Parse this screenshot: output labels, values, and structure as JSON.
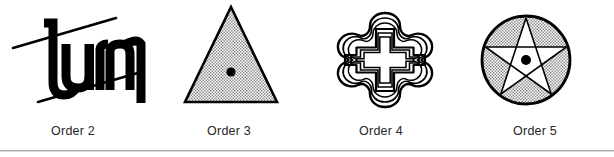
{
  "figure": {
    "background_color": "#ffffff",
    "ink_color": "#000000",
    "caption_color": "#262626",
    "rule_color": "#a8a8a8",
    "stipple_color": "#b5b5b5",
    "panels": [
      {
        "id": "panel-order-2",
        "caption": "Order 2",
        "order": 2,
        "symmetry": "2-fold rotational",
        "artwork_name": "turn-ambigram",
        "artwork_text": "turn",
        "description": "Ambigram lettering of the word turn with two parallel slanted rules",
        "has_center_dot": false,
        "fill": "solid-black-lettering"
      },
      {
        "id": "panel-order-3",
        "caption": "Order 3",
        "order": 3,
        "symmetry": "3-fold rotational",
        "artwork_name": "stippled-triangle",
        "artwork_text": "",
        "description": "Equilateral triangle with stippled gray fill and black center dot",
        "has_center_dot": true,
        "fill": "stipple-gray"
      },
      {
        "id": "panel-order-4",
        "caption": "Order 4",
        "order": 4,
        "symmetry": "4-fold rotational",
        "artwork_name": "nested-quatrefoil-cross",
        "artwork_text": "",
        "description": "Nested concentric wavy cross or quatrefoil outlines, white fill",
        "has_center_dot": false,
        "fill": "white-outline"
      },
      {
        "id": "panel-order-5",
        "caption": "Order 5",
        "order": 5,
        "symmetry": "5-fold rotational",
        "artwork_name": "pentagram-in-circle",
        "artwork_text": "",
        "description": "Circle with stippled gray fill containing a white pentagram and black center dot",
        "has_center_dot": true,
        "fill": "stipple-gray"
      }
    ]
  }
}
